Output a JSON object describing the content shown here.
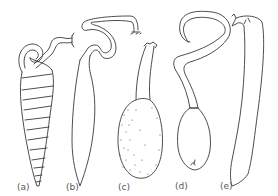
{
  "figure": {
    "panels": [
      {
        "id": "a",
        "label": "(a)",
        "description": "tapered spiral-ringed tube with coiled neck and flared tip"
      },
      {
        "id": "b",
        "label": "(b)",
        "description": "elongate fusiform body with long looping neck and frilled tip"
      },
      {
        "id": "c",
        "label": "(c)",
        "description": "stippled ovoid body with long neck and frilled tip"
      },
      {
        "id": "d",
        "label": "(d)",
        "description": "smooth ovoid body with hooked looping neck"
      },
      {
        "id": "e",
        "label": "(e)",
        "description": "long slender elongate body with frilled tip"
      }
    ],
    "colors": {
      "stroke": "#3a3a3a",
      "background": "#ffffff",
      "label": "#555555"
    }
  }
}
